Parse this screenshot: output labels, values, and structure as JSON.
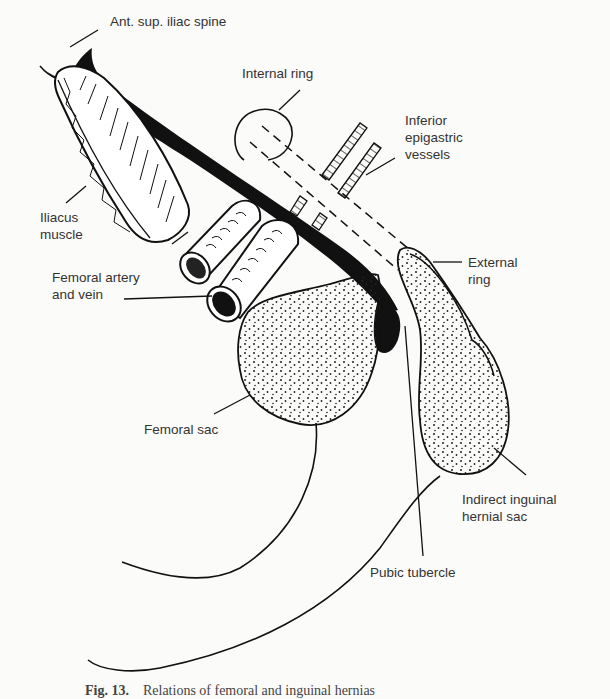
{
  "figure": {
    "caption_prefix": "Fig. 13.",
    "caption_text": "Relations of femoral and inguinal hernias",
    "labels": {
      "ant_sup_iliac_spine": "Ant. sup. iliac spine",
      "internal_ring": "Internal ring",
      "inferior_epigastric_1": "Inferior",
      "inferior_epigastric_2": "epigastric",
      "inferior_epigastric_3": "vessels",
      "iliacus_1": "Iliacus",
      "iliacus_2": "muscle",
      "femoral_vessels_1": "Femoral artery",
      "femoral_vessels_2": "and vein",
      "external_ring_1": "External",
      "external_ring_2": "ring",
      "femoral_sac": "Femoral sac",
      "indirect_sac_1": "Indirect inguinal",
      "indirect_sac_2": "hernial sac",
      "pubic_tubercle": "Pubic tubercle"
    },
    "colors": {
      "ink": "#111111",
      "background": "#fbfbfa"
    }
  }
}
